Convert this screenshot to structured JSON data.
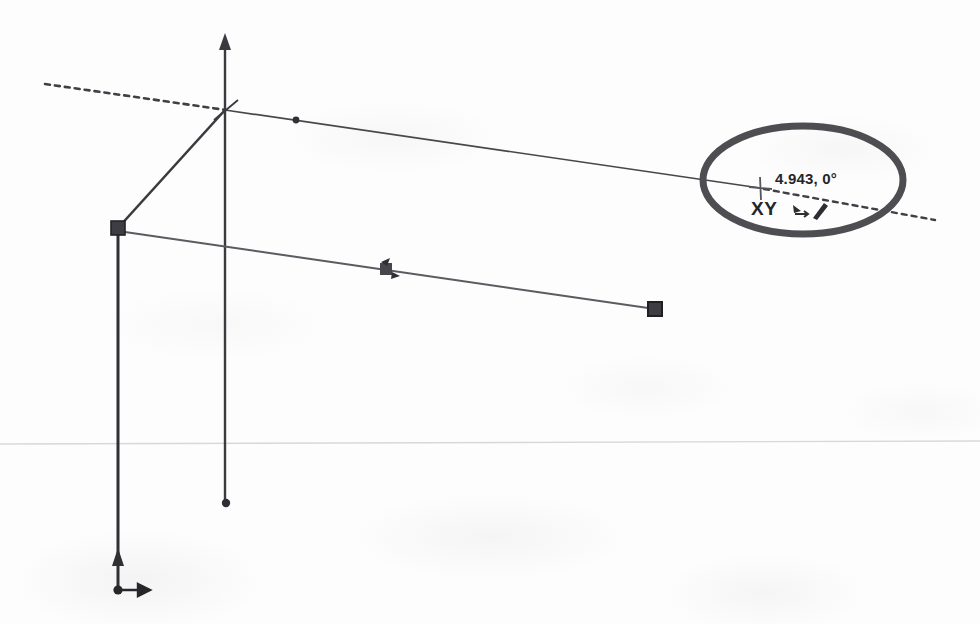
{
  "app": {
    "kind": "cad-viewport",
    "capture_width": 980,
    "capture_height": 624,
    "background_color": "#fdfdfd",
    "ink_color": "#3a3a3f",
    "annotation_color": "#4a4a50"
  },
  "readout": {
    "coordinates": "4.943, 0°",
    "distance_value": "4.943",
    "angle_value": "0°",
    "axis_lock_label": "XY",
    "snap_icons": [
      "move-cursor-icon",
      "line-tool-icon"
    ]
  },
  "cursor": {
    "icon": "crosshair-cursor-icon",
    "x": 760,
    "y": 188
  },
  "annotation": {
    "shape": "ellipse",
    "name": "highlight-ellipse",
    "cx": 803,
    "cy": 180,
    "rx": 100,
    "ry": 54,
    "stroke_width": 7,
    "color": "#4d4d52"
  },
  "geometry": {
    "axis_vertical": {
      "label": "vertical-axis",
      "x1": 225,
      "y1": 36,
      "x2": 225,
      "y2": 505,
      "arrow_head": "up",
      "end_marker": "dot"
    },
    "axis_horizontal_dashed": {
      "label": "xy-construction-axis",
      "x1": 45,
      "y1": 84,
      "x2": 935,
      "y2": 220,
      "style": "dashed",
      "solid_until_x": 760
    },
    "upper_edge": {
      "label": "upper-edge-line",
      "x1": 225,
      "y1": 110,
      "x2": 760,
      "y2": 188,
      "marker_dot": {
        "x": 296,
        "y": 120
      }
    },
    "diagonal_brace": {
      "label": "diagonal-brace",
      "x1": 225,
      "y1": 110,
      "x2": 118,
      "y2": 228
    },
    "lower_edge": {
      "label": "lower-edge-line",
      "x1": 118,
      "y1": 231,
      "x2": 655,
      "y2": 309,
      "midpoint_marker": {
        "x": 386,
        "y": 269,
        "icon": "midpoint-snap-icon"
      }
    },
    "left_post": {
      "label": "left-vertical-post",
      "x1": 118,
      "y1": 231,
      "x2": 118,
      "y2": 592,
      "arrow_head": "up",
      "arrow_y": 556,
      "end_marker": "dot",
      "foot_arrow": "right"
    },
    "horizon_line": {
      "label": "faint-horizon-line",
      "x1": 0,
      "y1": 444,
      "x2": 980,
      "y2": 441
    },
    "handles": [
      {
        "name": "endpoint-handle-upper-left",
        "x": 118,
        "y": 228,
        "shape": "square"
      },
      {
        "name": "endpoint-handle-lower-right",
        "x": 655,
        "y": 309,
        "shape": "square"
      }
    ]
  }
}
